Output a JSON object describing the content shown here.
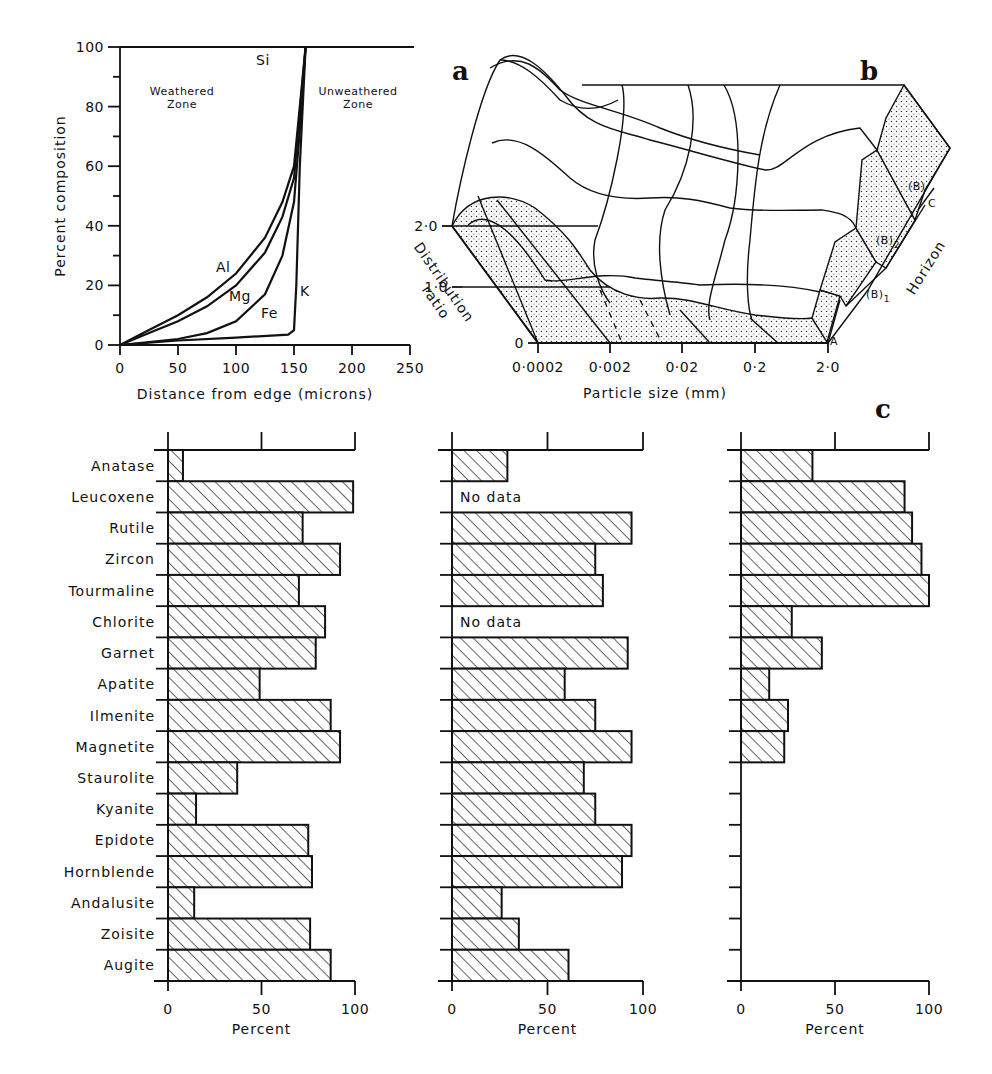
{
  "panels": {
    "a": {
      "label": "a"
    },
    "b": {
      "label": "b"
    },
    "c": {
      "label": "c"
    }
  },
  "chart_data": [
    {
      "id": "a",
      "type": "line",
      "title": "",
      "xlabel": "Distance from edge (microns)",
      "ylabel": "Percent composition",
      "xlim": [
        0,
        250
      ],
      "ylim": [
        0,
        100
      ],
      "xticks": [
        0,
        50,
        100,
        150,
        200,
        250
      ],
      "yticks": [
        0,
        20,
        40,
        60,
        80,
        100
      ],
      "annotations": [
        "Weathered Zone",
        "Unweathered Zone"
      ],
      "series": [
        {
          "name": "Si",
          "x": [
            0,
            250
          ],
          "y": [
            100,
            100
          ]
        },
        {
          "name": "Al",
          "x": [
            0,
            25,
            50,
            75,
            100,
            125,
            140,
            150,
            155,
            160
          ],
          "y": [
            0,
            5,
            10,
            16,
            24,
            36,
            48,
            60,
            80,
            100
          ]
        },
        {
          "name": "Mg",
          "x": [
            0,
            25,
            50,
            75,
            100,
            125,
            140,
            150,
            155,
            160
          ],
          "y": [
            0,
            4,
            8,
            13,
            20,
            31,
            43,
            56,
            78,
            100
          ]
        },
        {
          "name": "Fe",
          "x": [
            0,
            25,
            50,
            75,
            100,
            125,
            140,
            150,
            155,
            160
          ],
          "y": [
            0,
            1,
            2,
            4,
            8,
            17,
            30,
            48,
            72,
            100
          ]
        },
        {
          "name": "K",
          "x": [
            0,
            50,
            100,
            145,
            150,
            152,
            155,
            160
          ],
          "y": [
            0,
            1.5,
            2.5,
            3.5,
            5,
            20,
            60,
            100
          ]
        }
      ]
    },
    {
      "id": "b",
      "type": "area",
      "title": "",
      "xlabel": "Particle size (mm)",
      "ylabel": "Distribution ratio",
      "zlabel": "Horizon",
      "xticks": [
        "0·0002",
        "0·002",
        "0·02",
        "0·2",
        "2·0"
      ],
      "yticks": [
        "0",
        "1·0",
        "2·0"
      ],
      "horizons": [
        "A",
        "(B)1",
        "(B)2",
        "(B)/C"
      ]
    },
    {
      "id": "c",
      "type": "bar",
      "xlabel": "Percent",
      "xlim": [
        0,
        100
      ],
      "xticks": [
        0,
        50,
        100
      ],
      "categories": [
        "Anatase",
        "Leucoxene",
        "Rutile",
        "Zircon",
        "Tourmaline",
        "Chlorite",
        "Garnet",
        "Apatite",
        "Ilmenite",
        "Magnetite",
        "Staurolite",
        "Kyanite",
        "Epidote",
        "Hornblende",
        "Andalusite",
        "Zoisite",
        "Augite"
      ],
      "series": [
        {
          "name": "left",
          "values": [
            8,
            99,
            72,
            92,
            70,
            84,
            79,
            49,
            87,
            92,
            37,
            15,
            75,
            77,
            14,
            76,
            87
          ]
        },
        {
          "name": "middle",
          "values": [
            29,
            null,
            94,
            75,
            79,
            null,
            92,
            59,
            75,
            94,
            69,
            75,
            94,
            89,
            26,
            35,
            61
          ],
          "null_label": "No data"
        },
        {
          "name": "right",
          "values": [
            38,
            87,
            91,
            96,
            100,
            27,
            43,
            15,
            25,
            23,
            null,
            null,
            null,
            null,
            null,
            null,
            null
          ]
        }
      ]
    }
  ]
}
